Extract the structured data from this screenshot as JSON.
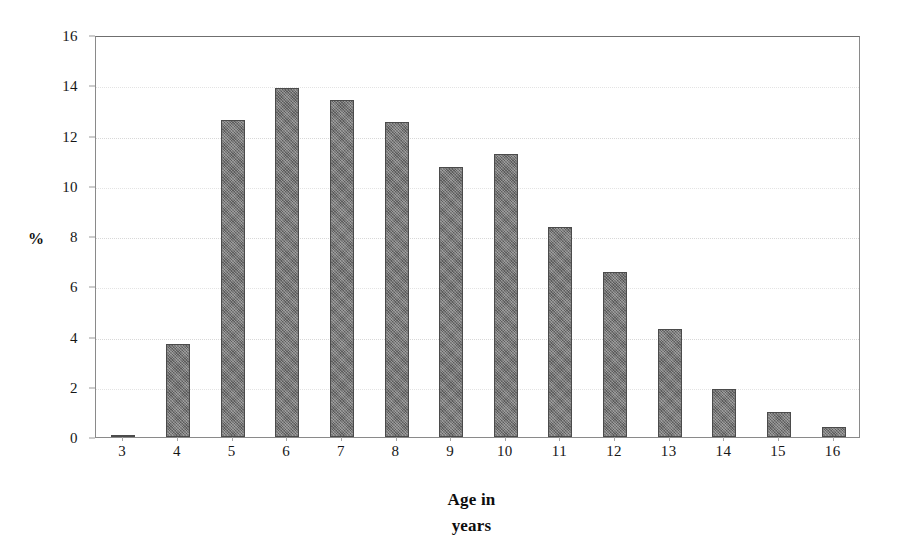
{
  "chart_data": {
    "type": "bar",
    "title": "",
    "xlabel": "Age in years",
    "xlabel_lines": [
      "Age in",
      "years"
    ],
    "ylabel": "%",
    "categories": [
      "3",
      "4",
      "5",
      "6",
      "7",
      "8",
      "9",
      "10",
      "11",
      "12",
      "13",
      "14",
      "15",
      "16"
    ],
    "values": [
      0.1,
      3.7,
      12.6,
      13.9,
      13.4,
      12.55,
      10.75,
      11.25,
      8.35,
      6.55,
      4.3,
      1.9,
      1.0,
      0.4
    ],
    "ylim": [
      0,
      16
    ],
    "ytick_values": [
      0,
      2,
      4,
      6,
      8,
      10,
      12,
      14,
      16
    ],
    "ytick_labels": [
      "0",
      "2",
      "4",
      "6",
      "8",
      "10",
      "12",
      "14",
      "16"
    ],
    "grid": true,
    "grid_axis": "y",
    "legend": false,
    "legend_position": "none",
    "bar_color": "#6e6e6e",
    "bar_edge_color": "#4b4b4b",
    "grid_color": "#dcdcdc",
    "axis_color": "#8a8a8a",
    "background_color": "#ffffff"
  }
}
